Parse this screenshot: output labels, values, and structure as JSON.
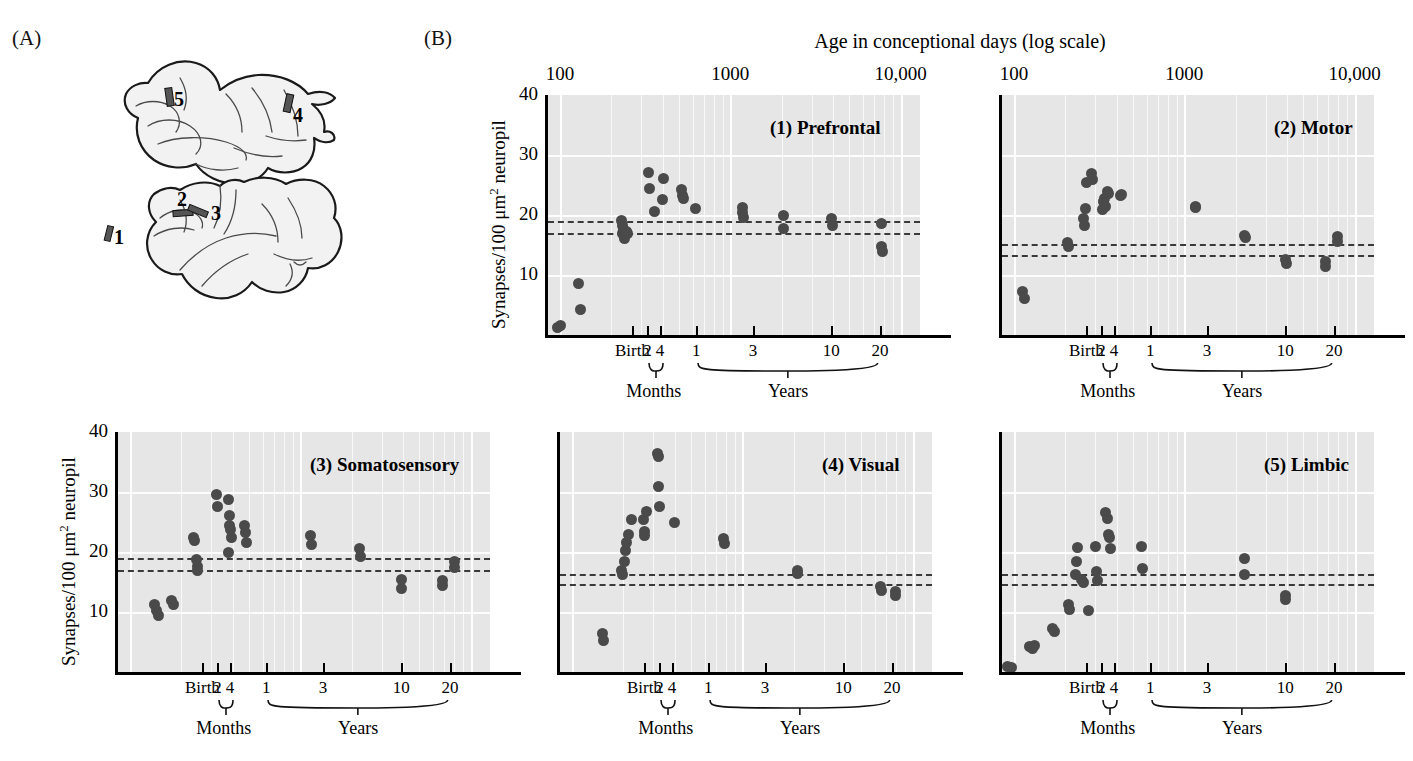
{
  "figure": {
    "panel_a_letter": "(A)",
    "panel_b_letter": "(B)",
    "top_axis_title": "Age in conceptional days (log scale)"
  },
  "brain": {
    "site_labels": [
      "1",
      "2",
      "3",
      "4",
      "5"
    ],
    "description": "two lateral-view cerebral cortex outlines with five shaded sampling sites"
  },
  "axes": {
    "y_title_prefix": "Synapses/100 ",
    "y_title_unit": "μm",
    "y_title_sup": "2",
    "y_title_suffix": " neuropil",
    "y_ticks": [
      "40",
      "30",
      "20",
      "10"
    ],
    "top_ticks": [
      "100",
      "1000",
      "10,000"
    ],
    "x_ticks": [
      "Birth",
      "2",
      "4",
      "1",
      "3",
      "10",
      "20"
    ],
    "group_months": "Months",
    "group_years": "Years"
  },
  "chart_data": {
    "type": "scatter",
    "title": "Age in conceptional days (log scale)",
    "xlabel": "Age in conceptional days (log scale)",
    "ylabel": "Synapses/100 μm² neuropil",
    "xscale": "log",
    "xlim": [
      85,
      13000
    ],
    "ylim": [
      0,
      40
    ],
    "grid": true,
    "legend": "none",
    "x_tick_values": [
      100,
      1000,
      10000
    ],
    "x_tick_labels": [
      "100",
      "1000",
      "10,000"
    ],
    "y_tick_values": [
      10,
      20,
      30,
      40
    ],
    "secondary_x_ticks": [
      {
        "label": "Birth",
        "days": 266
      },
      {
        "label": "2",
        "days": 326,
        "group": "Months"
      },
      {
        "label": "4",
        "days": 386,
        "group": "Months"
      },
      {
        "label": "1",
        "days": 631,
        "group": "Years"
      },
      {
        "label": "3",
        "days": 1361,
        "group": "Years"
      },
      {
        "label": "10",
        "days": 3916,
        "group": "Years"
      },
      {
        "label": "20",
        "days": 7566,
        "group": "Years"
      }
    ],
    "reference_lines": [
      {
        "y": 19.0,
        "style": "dashed"
      },
      {
        "y": 17.0,
        "style": "dashed"
      }
    ],
    "panels": [
      {
        "id": 1,
        "title": "(1) Prefrontal",
        "reference_lines": [
          19.0,
          17.0
        ],
        "points": [
          {
            "x": 96,
            "y": 1.2
          },
          {
            "x": 100,
            "y": 1.6
          },
          {
            "x": 128,
            "y": 8.6
          },
          {
            "x": 131,
            "y": 4.3
          },
          {
            "x": 228,
            "y": 19.1
          },
          {
            "x": 232,
            "y": 18.2
          },
          {
            "x": 236,
            "y": 17.6
          },
          {
            "x": 233,
            "y": 17.0
          },
          {
            "x": 238,
            "y": 16.6
          },
          {
            "x": 240,
            "y": 16.1
          },
          {
            "x": 244,
            "y": 17.2
          },
          {
            "x": 248,
            "y": 16.9
          },
          {
            "x": 330,
            "y": 27.1
          },
          {
            "x": 336,
            "y": 24.5
          },
          {
            "x": 358,
            "y": 20.6
          },
          {
            "x": 404,
            "y": 26.1
          },
          {
            "x": 398,
            "y": 22.6
          },
          {
            "x": 520,
            "y": 24.2
          },
          {
            "x": 524,
            "y": 23.2
          },
          {
            "x": 530,
            "y": 22.8
          },
          {
            "x": 620,
            "y": 21.1
          },
          {
            "x": 1180,
            "y": 21.3
          },
          {
            "x": 1186,
            "y": 20.5
          },
          {
            "x": 1190,
            "y": 19.6
          },
          {
            "x": 2050,
            "y": 19.9
          },
          {
            "x": 2060,
            "y": 17.8
          },
          {
            "x": 3950,
            "y": 19.4
          },
          {
            "x": 3960,
            "y": 18.2
          },
          {
            "x": 7700,
            "y": 18.6
          },
          {
            "x": 7750,
            "y": 14.8
          },
          {
            "x": 7780,
            "y": 13.9
          }
        ]
      },
      {
        "id": 2,
        "title": "(2) Motor",
        "reference_lines": [
          15.1,
          13.4
        ],
        "points": [
          {
            "x": 112,
            "y": 7.2
          },
          {
            "x": 115,
            "y": 6.1
          },
          {
            "x": 205,
            "y": 15.4
          },
          {
            "x": 208,
            "y": 14.7
          },
          {
            "x": 254,
            "y": 19.4
          },
          {
            "x": 258,
            "y": 18.3
          },
          {
            "x": 262,
            "y": 21.1
          },
          {
            "x": 268,
            "y": 25.4
          },
          {
            "x": 286,
            "y": 26.9
          },
          {
            "x": 290,
            "y": 26.0
          },
          {
            "x": 330,
            "y": 20.9
          },
          {
            "x": 336,
            "y": 22.3
          },
          {
            "x": 340,
            "y": 22.8
          },
          {
            "x": 344,
            "y": 21.4
          },
          {
            "x": 352,
            "y": 23.9
          },
          {
            "x": 358,
            "y": 23.6
          },
          {
            "x": 420,
            "y": 23.2
          },
          {
            "x": 428,
            "y": 23.5
          },
          {
            "x": 1160,
            "y": 21.5
          },
          {
            "x": 1168,
            "y": 21.2
          },
          {
            "x": 2260,
            "y": 16.6
          },
          {
            "x": 2280,
            "y": 16.3
          },
          {
            "x": 3950,
            "y": 12.6
          },
          {
            "x": 3960,
            "y": 11.9
          },
          {
            "x": 6700,
            "y": 12.2
          },
          {
            "x": 6750,
            "y": 11.4
          },
          {
            "x": 7900,
            "y": 16.5
          },
          {
            "x": 7950,
            "y": 15.6
          }
        ]
      },
      {
        "id": 3,
        "title": "(3) Somatosensory",
        "reference_lines": [
          19.0,
          17.0
        ],
        "points": [
          {
            "x": 140,
            "y": 11.3
          },
          {
            "x": 143,
            "y": 10.2
          },
          {
            "x": 146,
            "y": 9.5
          },
          {
            "x": 176,
            "y": 11.9
          },
          {
            "x": 180,
            "y": 11.2
          },
          {
            "x": 236,
            "y": 22.5
          },
          {
            "x": 240,
            "y": 21.9
          },
          {
            "x": 244,
            "y": 18.7
          },
          {
            "x": 248,
            "y": 17.6
          },
          {
            "x": 250,
            "y": 17.0
          },
          {
            "x": 320,
            "y": 29.6
          },
          {
            "x": 326,
            "y": 27.6
          },
          {
            "x": 378,
            "y": 28.8
          },
          {
            "x": 384,
            "y": 26.1
          },
          {
            "x": 386,
            "y": 24.4
          },
          {
            "x": 390,
            "y": 23.8
          },
          {
            "x": 392,
            "y": 22.4
          },
          {
            "x": 380,
            "y": 19.9
          },
          {
            "x": 470,
            "y": 24.5
          },
          {
            "x": 476,
            "y": 23.2
          },
          {
            "x": 480,
            "y": 21.6
          },
          {
            "x": 1150,
            "y": 22.7
          },
          {
            "x": 1160,
            "y": 21.2
          },
          {
            "x": 2230,
            "y": 20.6
          },
          {
            "x": 2250,
            "y": 19.3
          },
          {
            "x": 3900,
            "y": 15.4
          },
          {
            "x": 3920,
            "y": 13.9
          },
          {
            "x": 6800,
            "y": 15.2
          },
          {
            "x": 6850,
            "y": 14.5
          },
          {
            "x": 8000,
            "y": 18.4
          },
          {
            "x": 8050,
            "y": 17.4
          }
        ]
      },
      {
        "id": 4,
        "title": "(4) Visual",
        "reference_lines": [
          16.4,
          14.6
        ],
        "points": [
          {
            "x": 150,
            "y": 6.4
          },
          {
            "x": 152,
            "y": 5.2
          },
          {
            "x": 196,
            "y": 16.9
          },
          {
            "x": 199,
            "y": 16.3
          },
          {
            "x": 202,
            "y": 18.5
          },
          {
            "x": 206,
            "y": 20.3
          },
          {
            "x": 210,
            "y": 21.6
          },
          {
            "x": 214,
            "y": 23.0
          },
          {
            "x": 222,
            "y": 25.5
          },
          {
            "x": 262,
            "y": 25.4
          },
          {
            "x": 266,
            "y": 23.4
          },
          {
            "x": 268,
            "y": 22.7
          },
          {
            "x": 272,
            "y": 26.8
          },
          {
            "x": 318,
            "y": 36.5
          },
          {
            "x": 322,
            "y": 35.9
          },
          {
            "x": 320,
            "y": 31.0
          },
          {
            "x": 324,
            "y": 27.6
          },
          {
            "x": 400,
            "y": 24.9
          },
          {
            "x": 780,
            "y": 22.2
          },
          {
            "x": 790,
            "y": 21.5
          },
          {
            "x": 2100,
            "y": 16.9
          },
          {
            "x": 2120,
            "y": 16.4
          },
          {
            "x": 6500,
            "y": 14.3
          },
          {
            "x": 6550,
            "y": 13.6
          },
          {
            "x": 7900,
            "y": 13.4
          },
          {
            "x": 7950,
            "y": 12.8
          }
        ]
      },
      {
        "id": 5,
        "title": "(5) Limbic",
        "reference_lines": [
          16.3,
          14.7
        ],
        "points": [
          {
            "x": 92,
            "y": 1.0
          },
          {
            "x": 96,
            "y": 0.7
          },
          {
            "x": 124,
            "y": 4.2
          },
          {
            "x": 128,
            "y": 3.9
          },
          {
            "x": 132,
            "y": 4.5
          },
          {
            "x": 168,
            "y": 7.3
          },
          {
            "x": 172,
            "y": 6.7
          },
          {
            "x": 208,
            "y": 11.3
          },
          {
            "x": 212,
            "y": 10.5
          },
          {
            "x": 228,
            "y": 16.2
          },
          {
            "x": 232,
            "y": 18.4
          },
          {
            "x": 236,
            "y": 20.7
          },
          {
            "x": 248,
            "y": 15.5
          },
          {
            "x": 254,
            "y": 14.9
          },
          {
            "x": 272,
            "y": 10.3
          },
          {
            "x": 300,
            "y": 20.9
          },
          {
            "x": 306,
            "y": 16.8
          },
          {
            "x": 310,
            "y": 15.2
          },
          {
            "x": 346,
            "y": 26.6
          },
          {
            "x": 352,
            "y": 25.6
          },
          {
            "x": 358,
            "y": 22.9
          },
          {
            "x": 362,
            "y": 22.4
          },
          {
            "x": 366,
            "y": 20.6
          },
          {
            "x": 560,
            "y": 20.9
          },
          {
            "x": 566,
            "y": 17.3
          },
          {
            "x": 2240,
            "y": 19.0
          },
          {
            "x": 2260,
            "y": 16.2
          },
          {
            "x": 3900,
            "y": 12.8
          },
          {
            "x": 3920,
            "y": 12.1
          }
        ]
      }
    ]
  }
}
